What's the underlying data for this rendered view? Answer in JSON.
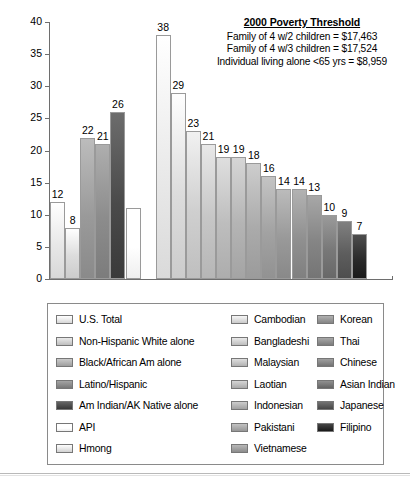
{
  "note": {
    "title": "2000 Poverty Threshold",
    "lines": [
      "Family of 4 w/2 children = $17,463",
      "Family of 4 w/3 children = $17,524",
      "Individual living alone <65 yrs = $8,959"
    ]
  },
  "chart_data": {
    "type": "bar",
    "title": "",
    "xlabel": "",
    "ylabel": "",
    "ylim": [
      0,
      40
    ],
    "yticks": [
      0,
      5,
      10,
      15,
      20,
      25,
      30,
      35,
      40
    ],
    "grid": false,
    "legend_position": "bottom",
    "categories": [
      "U.S. Total",
      "Non-Hispanic White alone",
      "Black/African Am alone",
      "Latino/Hispanic",
      "Am Indian/AK Native alone",
      "API",
      "Hmong",
      "Cambodian",
      "Bangladeshi",
      "Malaysian",
      "Laotian",
      "Indonesian",
      "Pakistani",
      "Vietnamese",
      "Korean",
      "Thai",
      "Chinese",
      "Asian Indian",
      "Japanese",
      "Filipino"
    ],
    "values": [
      12,
      8,
      22,
      21,
      26,
      11,
      38,
      29,
      23,
      21,
      19,
      19,
      18,
      16,
      14,
      14,
      13,
      10,
      9,
      7
    ],
    "data_labels": [
      "12",
      "8",
      "22",
      "21",
      "26",
      "",
      "38",
      "29",
      "23",
      "21",
      "19",
      "19",
      "18",
      "16",
      "14",
      "14",
      "13",
      "10",
      "9",
      "7"
    ],
    "colors": [
      "#e8e8e8",
      "#dcdcdc",
      "#9a9a9a",
      "#8c8c8c",
      "#4a4a4a",
      "#ffffff",
      "#eaeaea",
      "#dcdcdc",
      "#cfcfcf",
      "#c6c6c6",
      "#bdbdbd",
      "#b4b4b4",
      "#ababab",
      "#a2a2a2",
      "#999999",
      "#909090",
      "#858585",
      "#787878",
      "#5e5e5e",
      "#2b2b2b"
    ]
  },
  "legend": {
    "columns": [
      [
        {
          "label": "U.S. Total",
          "color": "#e8e8e8"
        },
        {
          "label": "Non-Hispanic White alone",
          "color": "#d0d0d0"
        },
        {
          "label": "Black/African Am alone",
          "color": "#b0b0b0"
        },
        {
          "label": "Latino/Hispanic",
          "color": "#8a8a8a"
        },
        {
          "label": "Am Indian/AK Native alone",
          "color": "#4a4a4a"
        },
        {
          "label": "API",
          "color": "#ffffff"
        },
        {
          "label": "Hmong",
          "color": "#e4e4e4"
        }
      ],
      [
        {
          "label": "Cambodian",
          "color": "#dcdcdc"
        },
        {
          "label": "Bangladeshi",
          "color": "#cfcfcf"
        },
        {
          "label": "Malaysian",
          "color": "#c4c4c4"
        },
        {
          "label": "Laotian",
          "color": "#bcbcbc"
        },
        {
          "label": "Indonesian",
          "color": "#b2b2b2"
        },
        {
          "label": "Pakistani",
          "color": "#a8a8a8"
        },
        {
          "label": "Vietnamese",
          "color": "#9e9e9e"
        }
      ],
      [
        {
          "label": "Korean",
          "color": "#969696"
        },
        {
          "label": "Thai",
          "color": "#8e8e8e"
        },
        {
          "label": "Chinese",
          "color": "#858585"
        },
        {
          "label": "Asian Indian",
          "color": "#767676"
        },
        {
          "label": "Japanese",
          "color": "#585858"
        },
        {
          "label": "Filipino",
          "color": "#2b2b2b"
        }
      ]
    ]
  }
}
